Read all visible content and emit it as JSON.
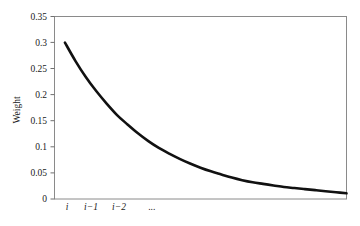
{
  "chart_data": {
    "type": "line",
    "title": "",
    "subtitle": "",
    "xlabel": "",
    "ylabel": "Weight",
    "grid": false,
    "legend": null,
    "background_color": "#ffffff",
    "line_color": "#111111",
    "axis_color": "#808080",
    "line_width": 2.6,
    "ylim": [
      0,
      0.35
    ],
    "ytick_labels": [
      "0",
      "0.05",
      "0.1",
      "0.15",
      "0.2",
      "0.25",
      "0.3",
      "0.35"
    ],
    "ytick_values": [
      0,
      0.05,
      0.1,
      0.15,
      0.2,
      0.25,
      0.3,
      0.35
    ],
    "xtick_labels": [
      "i",
      "i−1",
      "i−2",
      "..."
    ],
    "xtick_positions": [
      0,
      1,
      2,
      3.35
    ],
    "xlim": [
      -0.5,
      13.5
    ],
    "x": [
      0,
      0.5,
      1,
      1.5,
      2,
      2.5,
      3,
      3.5,
      4,
      4.5,
      5,
      5.5,
      6,
      6.5,
      7,
      7.5,
      8,
      8.5,
      9,
      9.5,
      10,
      10.5,
      11,
      11.5,
      12,
      12.5,
      13,
      13.5
    ],
    "values": [
      0.3,
      0.265,
      0.234,
      0.207,
      0.183,
      0.161,
      0.143,
      0.126,
      0.111,
      0.098,
      0.087,
      0.077,
      0.068,
      0.06,
      0.053,
      0.047,
      0.041,
      0.036,
      0.032,
      0.029,
      0.026,
      0.023,
      0.021,
      0.019,
      0.017,
      0.015,
      0.013,
      0.011
    ],
    "series": [
      {
        "name": "Weight",
        "values": [
          0.3,
          0.265,
          0.234,
          0.207,
          0.183,
          0.161,
          0.143,
          0.126,
          0.111,
          0.098,
          0.087,
          0.077,
          0.068,
          0.06,
          0.053,
          0.047,
          0.041,
          0.036,
          0.032,
          0.029,
          0.026,
          0.023,
          0.021,
          0.019,
          0.017,
          0.015,
          0.013,
          0.011
        ]
      }
    ],
    "annotations": []
  },
  "axis": {
    "y_label": "Weight",
    "ticks": {
      "y0": "0",
      "y1": "0.05",
      "y2": "0.1",
      "y3": "0.15",
      "y4": "0.2",
      "y5": "0.25",
      "y6": "0.3",
      "y7": "0.35"
    },
    "x_ticks": {
      "x0": "i",
      "x1": "i−1",
      "x2": "i−2",
      "x3": "..."
    }
  }
}
